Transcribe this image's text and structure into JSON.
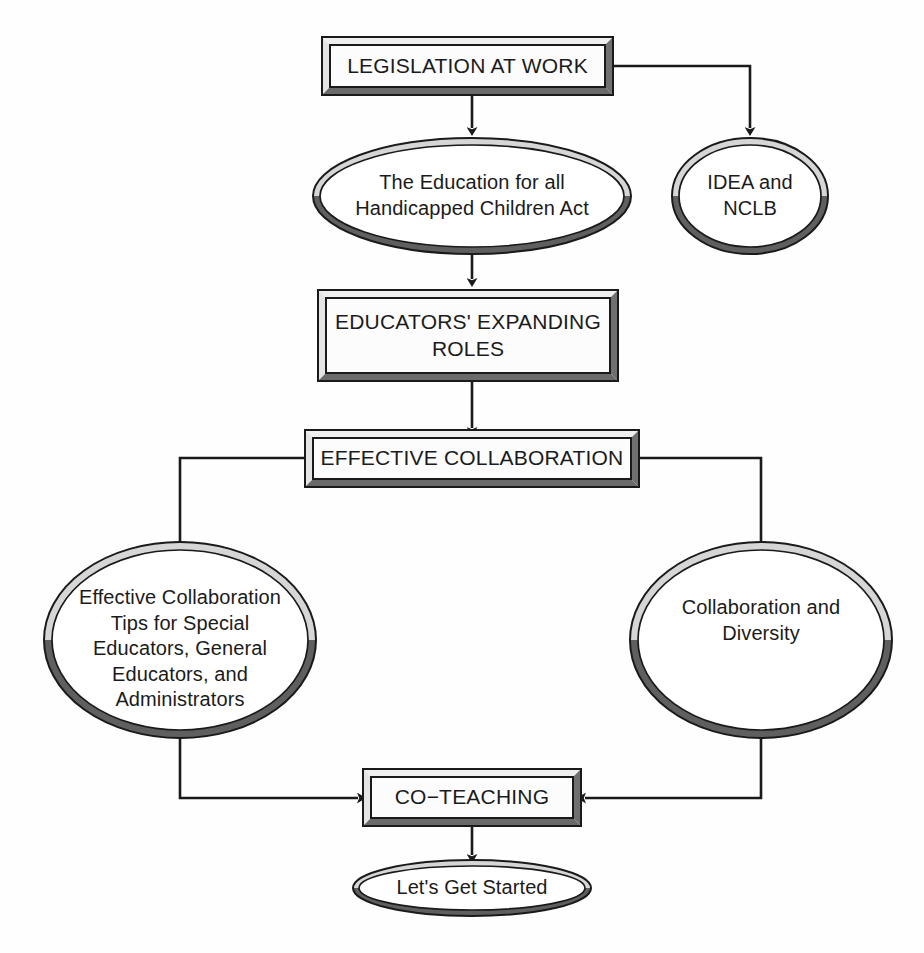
{
  "diagram": {
    "type": "flowchart",
    "background_color": "#ffffff",
    "line_color": "#1a1a1a",
    "bevel_light_color": "#e8e8e8",
    "bevel_dark_color": "#6e6e6e",
    "text_color": "#1b1b1b"
  },
  "nodes": {
    "legislation_at_work": {
      "label": "LEGISLATION AT WORK",
      "shape": "rectangle"
    },
    "education_act": {
      "label": "The Education for all\nHandicapped Children Act",
      "shape": "ellipse"
    },
    "idea_nclb": {
      "label": "IDEA and\nNCLB",
      "shape": "ellipse"
    },
    "educators_roles": {
      "label": "EDUCATORS' EXPANDING\nROLES",
      "shape": "rectangle"
    },
    "effective_collaboration": {
      "label": "EFFECTIVE COLLABORATION",
      "shape": "rectangle"
    },
    "collaboration_tips": {
      "label": "Effective Collaboration\nTips for Special\nEducators, General\nEducators, and\nAdministrators",
      "shape": "ellipse"
    },
    "collaboration_diversity": {
      "label": "Collaboration and\nDiversity",
      "shape": "ellipse"
    },
    "co_teaching": {
      "label": "CO−TEACHING",
      "shape": "rectangle"
    },
    "lets_get_started": {
      "label": "Let's Get Started",
      "shape": "ellipse"
    }
  },
  "edges": [
    {
      "name": "legislation-to-education-act",
      "from": "legislation_at_work",
      "to": "education_act",
      "style": "straight-down-arrow"
    },
    {
      "name": "legislation-to-idea-nclb",
      "from": "legislation_at_work",
      "to": "idea_nclb",
      "style": "right-then-down-arrow"
    },
    {
      "name": "education-act-to-educators-roles",
      "from": "education_act",
      "to": "educators_roles",
      "style": "straight-down-arrow"
    },
    {
      "name": "educators-roles-to-effective-collaboration",
      "from": "educators_roles",
      "to": "effective_collaboration",
      "style": "straight-down-arrow"
    },
    {
      "name": "effective-collaboration-to-collaboration-tips",
      "from": "effective_collaboration",
      "to": "collaboration_tips",
      "style": "left-then-down-arrow"
    },
    {
      "name": "effective-collaboration-to-collaboration-diversity",
      "from": "effective_collaboration",
      "to": "collaboration_diversity",
      "style": "right-then-down-arrow"
    },
    {
      "name": "collaboration-tips-to-co-teaching",
      "from": "collaboration_tips",
      "to": "co_teaching",
      "style": "down-then-right-arrow"
    },
    {
      "name": "collaboration-diversity-to-co-teaching",
      "from": "collaboration_diversity",
      "to": "co_teaching",
      "style": "down-then-left-arrow"
    },
    {
      "name": "co-teaching-to-lets-get-started",
      "from": "co_teaching",
      "to": "lets_get_started",
      "style": "straight-down-arrow"
    }
  ]
}
